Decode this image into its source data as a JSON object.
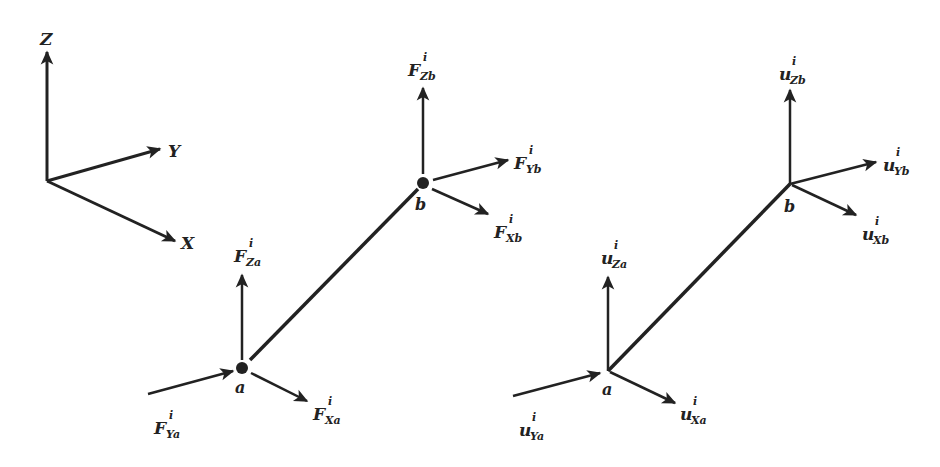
{
  "diagram": {
    "type": "3D beam element force/displacement diagram",
    "axes": {
      "z_label": "Z",
      "y_label": "Y",
      "x_label": "X"
    },
    "force_element": {
      "node_a": "a",
      "node_b": "b",
      "labels": {
        "za": {
          "main": "F",
          "sup": "i",
          "sub": "Za"
        },
        "ya": {
          "main": "F",
          "sup": "i",
          "sub": "Ya"
        },
        "xa": {
          "main": "F",
          "sup": "i",
          "sub": "Xa"
        },
        "zb": {
          "main": "F",
          "sup": "i",
          "sub": "Zb"
        },
        "yb": {
          "main": "F",
          "sup": "i",
          "sub": "Yb"
        },
        "xb": {
          "main": "F",
          "sup": "i",
          "sub": "Xb"
        }
      }
    },
    "displacement_element": {
      "node_a": "a",
      "node_b": "b",
      "labels": {
        "za": {
          "main": "u",
          "sup": "i",
          "sub": "Za"
        },
        "ya": {
          "main": "u",
          "sup": "i",
          "sub": "Ya"
        },
        "xa": {
          "main": "u",
          "sup": "i",
          "sub": "Xa"
        },
        "zb": {
          "main": "u",
          "sup": "i",
          "sub": "Zb"
        },
        "yb": {
          "main": "u",
          "sup": "i",
          "sub": "Yb"
        },
        "xb": {
          "main": "u",
          "sup": "i",
          "sub": "Xb"
        }
      }
    },
    "colors": {
      "ink": "#222222",
      "background": "#ffffff"
    }
  }
}
